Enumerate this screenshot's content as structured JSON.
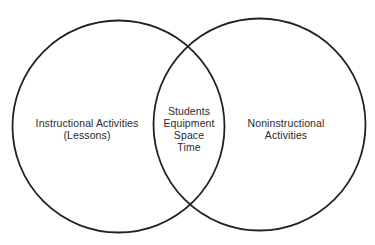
{
  "diagram": {
    "type": "venn",
    "stroke_color": "#222222",
    "background": "#ffffff",
    "sets": [
      {
        "id": "left",
        "lines": [
          "Instructional Activities",
          "(Lessons)"
        ]
      },
      {
        "id": "right",
        "lines": [
          "Noninstructional",
          "Activities"
        ]
      }
    ],
    "intersection": {
      "lines": [
        "Students",
        "Equipment",
        "Space",
        "Time"
      ]
    }
  }
}
